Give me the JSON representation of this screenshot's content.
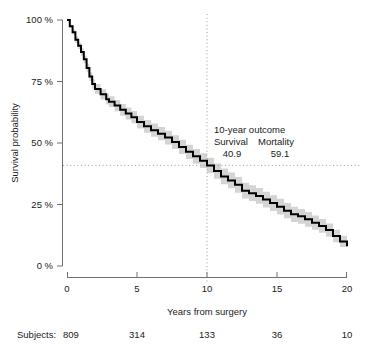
{
  "figure": {
    "clipped_title": "",
    "background": "#ffffff"
  },
  "chart_data": {
    "type": "line",
    "title": "",
    "subtitle": "",
    "xlabel": "Years from surgery",
    "ylabel": "Survival probability",
    "xlim": [
      0,
      20
    ],
    "ylim": [
      0,
      100
    ],
    "grid": false,
    "legend": null,
    "xticks": [
      0,
      5,
      10,
      15,
      20
    ],
    "xticklabels": [
      "0",
      "5",
      "10",
      "15",
      "20"
    ],
    "yticks": [
      0,
      25,
      50,
      75,
      100
    ],
    "yticklabels": [
      "0 %",
      "25 %",
      "50 %",
      "75 %",
      "100 %"
    ],
    "series": [
      {
        "name": "Kaplan-Meier survival estimate",
        "color": "#000000",
        "x": [
          0,
          0.2,
          0.4,
          0.6,
          0.8,
          1.0,
          1.2,
          1.4,
          1.6,
          1.8,
          2.0,
          2.4,
          2.8,
          3.0,
          3.4,
          3.8,
          4.2,
          4.6,
          5.0,
          5.5,
          6.0,
          6.5,
          7.0,
          7.5,
          8.0,
          8.5,
          9.0,
          9.5,
          10.0,
          10.5,
          11.0,
          11.5,
          12.0,
          12.5,
          13.0,
          13.5,
          14.0,
          14.5,
          15.0,
          15.5,
          16.0,
          16.5,
          17.0,
          17.5,
          18.0,
          18.5,
          19.0,
          19.5,
          20.0
        ],
        "y": [
          100.0,
          97.5,
          95.0,
          92.0,
          89.5,
          87.0,
          84.0,
          80.5,
          77.0,
          74.0,
          72.0,
          69.8,
          67.8,
          66.8,
          65.2,
          63.5,
          62.0,
          60.5,
          58.5,
          56.8,
          55.2,
          53.8,
          52.2,
          50.4,
          48.4,
          46.4,
          44.6,
          42.8,
          40.9,
          38.6,
          36.4,
          34.8,
          33.0,
          30.6,
          29.6,
          28.5,
          27.0,
          25.6,
          24.1,
          22.5,
          21.0,
          20.2,
          19.0,
          17.6,
          16.3,
          14.6,
          12.2,
          10.0,
          8.0
        ]
      }
    ],
    "confidence_band": {
      "name": "95% confidence interval",
      "color": "#d4d4d4",
      "half_width_pct": [
        0.0,
        0.7,
        1.0,
        1.2,
        1.3,
        1.5,
        1.6,
        1.7,
        1.8,
        1.9,
        2.0,
        2.1,
        2.2,
        2.2,
        2.3,
        2.4,
        2.4,
        2.5,
        2.6,
        2.6,
        2.7,
        2.7,
        2.8,
        2.8,
        2.9,
        2.9,
        3.0,
        3.0,
        3.1,
        3.1,
        3.2,
        3.2,
        3.2,
        3.2,
        3.2,
        3.2,
        3.2,
        3.2,
        3.2,
        3.1,
        3.1,
        3.0,
        3.0,
        2.9,
        2.8,
        2.7,
        2.5,
        2.3,
        2.0
      ]
    },
    "reference_lines": [
      {
        "name": "ten-year-vertical",
        "orientation": "vertical",
        "value": 10,
        "style": "dotted",
        "color": "#9a9a9a"
      },
      {
        "name": "survival-horizontal",
        "orientation": "horizontal",
        "value": 40.9,
        "style": "dotted",
        "color": "#9a9a9a"
      }
    ],
    "annotations": {
      "heading": "10-year outcome",
      "col_survival_label": "Survival",
      "col_mortality_label": "Mortality",
      "survival_value": "40.9",
      "mortality_value": "59.1"
    },
    "risk_table": {
      "row_label": "Subjects:",
      "times": [
        0,
        5,
        10,
        15,
        20
      ],
      "counts": [
        "809",
        "314",
        "133",
        "36",
        "10"
      ]
    }
  }
}
